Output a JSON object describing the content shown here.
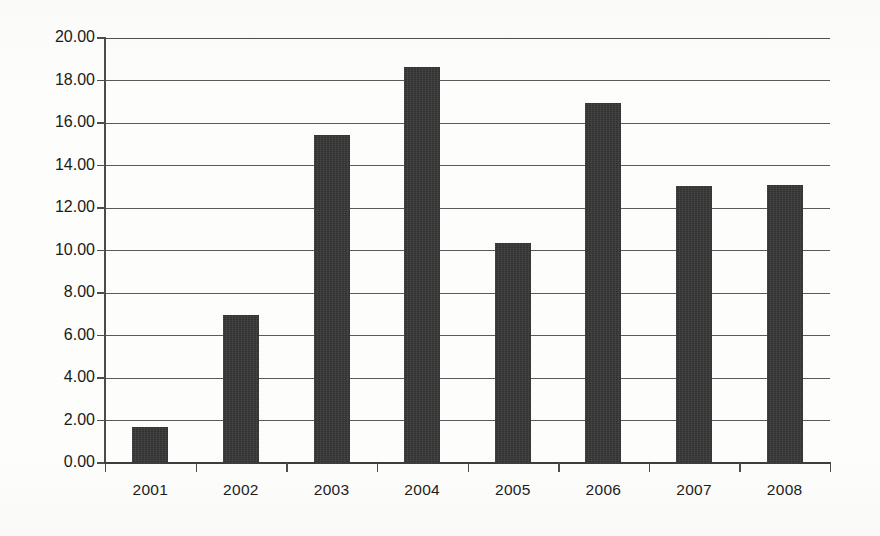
{
  "chart_data": {
    "type": "bar",
    "title": "",
    "subtitle": "",
    "xlabel": "",
    "ylabel": "",
    "categories": [
      "2001",
      "2002",
      "2003",
      "2004",
      "2005",
      "2006",
      "2007",
      "2008"
    ],
    "values": [
      1.7,
      6.98,
      15.42,
      18.64,
      10.34,
      16.92,
      13.02,
      13.06
    ],
    "ylim": [
      0,
      20
    ],
    "ytick_step": 2,
    "ytick_labels": [
      "0.00",
      "2.00",
      "4.00",
      "6.00",
      "8.00",
      "10.00",
      "12.00",
      "14.00",
      "16.00",
      "18.00",
      "20.00"
    ],
    "ytick_values": [
      0,
      2,
      4,
      6,
      8,
      10,
      12,
      14,
      16,
      18,
      20
    ],
    "grid": true,
    "grid_axis": "y",
    "legend": false,
    "legend_position": "none",
    "data_labels": false,
    "series_name": "",
    "bar_color": "#323232",
    "grid_color": "#5a5a5a",
    "axis_color": "#3d3d3d",
    "background_color": "#fdfdfc",
    "text_color": "#1c1c1c"
  }
}
